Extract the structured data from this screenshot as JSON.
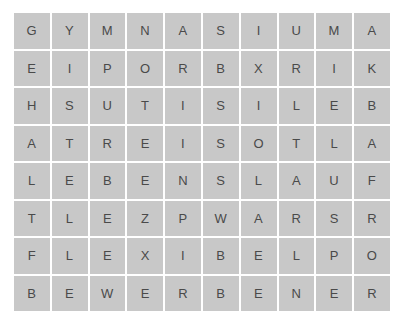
{
  "puzzle": {
    "type": "word-search-grid",
    "rows": 8,
    "columns": 10,
    "cell_background_color": "#c8c8c8",
    "letter_color": "#4a4a4a",
    "page_background_color": "#ffffff",
    "grid": [
      [
        "G",
        "Y",
        "M",
        "N",
        "A",
        "S",
        "I",
        "U",
        "M",
        "A"
      ],
      [
        "E",
        "I",
        "P",
        "O",
        "R",
        "B",
        "X",
        "R",
        "I",
        "K"
      ],
      [
        "H",
        "S",
        "U",
        "T",
        "I",
        "S",
        "I",
        "L",
        "E",
        "B"
      ],
      [
        "A",
        "T",
        "R",
        "E",
        "I",
        "S",
        "O",
        "T",
        "L",
        "A"
      ],
      [
        "L",
        "E",
        "B",
        "E",
        "N",
        "S",
        "L",
        "A",
        "U",
        "F"
      ],
      [
        "T",
        "L",
        "E",
        "Z",
        "P",
        "W",
        "A",
        "R",
        "S",
        "R"
      ],
      [
        "F",
        "L",
        "E",
        "X",
        "I",
        "B",
        "E",
        "L",
        "P",
        "O"
      ],
      [
        "B",
        "E",
        "W",
        "E",
        "R",
        "B",
        "E",
        "N",
        "E",
        "R"
      ]
    ],
    "rows_as_text": [
      "GYMNASIUMA",
      "EIPORBXRIK",
      "HSUTISILEB",
      "ATREISOTLA",
      "LEBENSLAUF",
      "TLEZPWARSR",
      "FLEXIBELPO",
      "BEWERBENER"
    ]
  }
}
